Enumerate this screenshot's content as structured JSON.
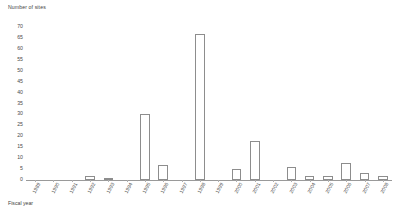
{
  "chart_data": {
    "type": "bar",
    "title": "",
    "ylabel": "Number of sites",
    "xlabel": "Fiscal year",
    "ylim": [
      0,
      70
    ],
    "ytick_step": 5,
    "yticks": [
      0,
      5,
      10,
      15,
      20,
      25,
      30,
      35,
      40,
      45,
      50,
      55,
      60,
      65,
      70
    ],
    "grid": false,
    "legend": null,
    "categories": [
      "1989",
      "1990",
      "1991",
      "1992",
      "1993",
      "1994",
      "1995",
      "1996",
      "1997",
      "1998",
      "1999",
      "2000",
      "2001",
      "2002",
      "2003",
      "2004",
      "2005",
      "2006",
      "2007",
      "2008"
    ],
    "values": [
      0,
      0,
      0,
      2,
      1,
      0,
      30,
      7,
      0,
      67,
      0,
      5,
      18,
      0,
      6,
      2,
      2,
      8,
      3,
      2
    ],
    "bar_style": {
      "fill": "#ffffff",
      "edge": "#8d8d8d"
    }
  },
  "axes": {
    "y_title": "Number of sites",
    "x_title": "Fiscal year"
  }
}
